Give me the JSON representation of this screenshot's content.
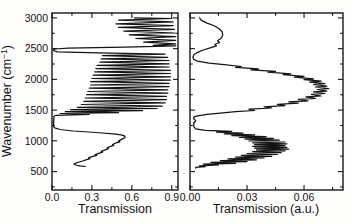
{
  "figure": {
    "kind": "dual-panel transmission spectra",
    "background_color": "#fdfdfc",
    "ink_color": "#161616"
  },
  "y_axis": {
    "label_pre": "Wavenumber (cm",
    "label_sup": "−1",
    "label_post": ")"
  },
  "chart_data": {
    "type": "line",
    "title": "",
    "ylabel": "Wavenumber (cm−1)",
    "ylim": [
      200,
      3080
    ],
    "yticks": [
      500,
      1000,
      1500,
      2000,
      2500,
      3000
    ],
    "ytick_labels": [
      "500",
      "1000",
      "1500",
      "2000",
      "2500",
      "3000"
    ],
    "yticks_minor": [
      250,
      750,
      1250,
      1750,
      2250,
      2750
    ],
    "grid": false,
    "legend": false,
    "panels": [
      {
        "name": "left",
        "xlabel": "Transmission",
        "xlim": [
          0,
          0.947
        ],
        "xticks": [
          0.0,
          0.3,
          0.6,
          0.9
        ],
        "xtick_labels": [
          "0.0",
          "0.3",
          "0.6",
          "0.9"
        ],
        "xticks_minor": [
          0.15,
          0.45,
          0.75
        ],
        "series": [
          {
            "name": "film-transmission-spectrum",
            "points": [
              [
                0.62,
                3000
              ],
              [
                0.9,
                2990
              ],
              [
                0.5,
                2965
              ],
              [
                0.91,
                2935
              ],
              [
                0.48,
                2905
              ],
              [
                0.91,
                2875
              ],
              [
                0.5,
                2845
              ],
              [
                0.92,
                2815
              ],
              [
                0.54,
                2785
              ],
              [
                0.92,
                2755
              ],
              [
                0.58,
                2725
              ],
              [
                0.93,
                2695
              ],
              [
                0.63,
                2665
              ],
              [
                0.93,
                2635
              ],
              [
                0.69,
                2605
              ],
              [
                0.93,
                2578
              ],
              [
                0.76,
                2555
              ],
              [
                0.93,
                2545
              ],
              [
                0.55,
                2525
              ],
              [
                0.12,
                2508
              ],
              [
                0.02,
                2495
              ],
              [
                0.01,
                2470
              ],
              [
                0.04,
                2448
              ],
              [
                0.35,
                2430
              ],
              [
                0.85,
                2412
              ],
              [
                0.38,
                2386
              ],
              [
                0.87,
                2360
              ],
              [
                0.37,
                2333
              ],
              [
                0.88,
                2307
              ],
              [
                0.36,
                2280
              ],
              [
                0.88,
                2254
              ],
              [
                0.34,
                2227
              ],
              [
                0.88,
                2201
              ],
              [
                0.33,
                2174
              ],
              [
                0.89,
                2148
              ],
              [
                0.32,
                2121
              ],
              [
                0.89,
                2095
              ],
              [
                0.31,
                2068
              ],
              [
                0.89,
                2042
              ],
              [
                0.3,
                2015
              ],
              [
                0.89,
                1989
              ],
              [
                0.29,
                1962
              ],
              [
                0.88,
                1936
              ],
              [
                0.29,
                1909
              ],
              [
                0.88,
                1883
              ],
              [
                0.28,
                1856
              ],
              [
                0.87,
                1830
              ],
              [
                0.27,
                1803
              ],
              [
                0.87,
                1777
              ],
              [
                0.26,
                1750
              ],
              [
                0.86,
                1724
              ],
              [
                0.25,
                1697
              ],
              [
                0.86,
                1671
              ],
              [
                0.24,
                1644
              ],
              [
                0.85,
                1618
              ],
              [
                0.22,
                1591
              ],
              [
                0.83,
                1565
              ],
              [
                0.19,
                1544
              ],
              [
                0.79,
                1526
              ],
              [
                0.14,
                1508
              ],
              [
                0.68,
                1490
              ],
              [
                0.1,
                1474
              ],
              [
                0.5,
                1458
              ],
              [
                0.06,
                1444
              ],
              [
                0.28,
                1428
              ],
              [
                0.03,
                1415
              ],
              [
                0.015,
                1400
              ],
              [
                0.012,
                1300
              ],
              [
                0.012,
                1230
              ],
              [
                0.02,
                1210
              ],
              [
                0.06,
                1185
              ],
              [
                0.16,
                1160
              ],
              [
                0.33,
                1135
              ],
              [
                0.46,
                1115
              ],
              [
                0.52,
                1098
              ],
              [
                0.545,
                1080
              ],
              [
                0.55,
                1062
              ],
              [
                0.54,
                1040
              ],
              [
                0.515,
                1015
              ],
              [
                0.5,
                995
              ],
              [
                0.51,
                985
              ],
              [
                0.475,
                962
              ],
              [
                0.455,
                940
              ],
              [
                0.465,
                928
              ],
              [
                0.435,
                905
              ],
              [
                0.415,
                885
              ],
              [
                0.425,
                872
              ],
              [
                0.395,
                850
              ],
              [
                0.37,
                828
              ],
              [
                0.38,
                816
              ],
              [
                0.35,
                795
              ],
              [
                0.325,
                775
              ],
              [
                0.335,
                763
              ],
              [
                0.3,
                742
              ],
              [
                0.275,
                722
              ],
              [
                0.285,
                710
              ],
              [
                0.255,
                690
              ],
              [
                0.23,
                672
              ],
              [
                0.205,
                655
              ],
              [
                0.18,
                638
              ],
              [
                0.165,
                622
              ],
              [
                0.175,
                606
              ],
              [
                0.21,
                593
              ],
              [
                0.25,
                583
              ]
            ]
          }
        ]
      },
      {
        "name": "right",
        "xlabel": "Transmission (a.u.)",
        "xlim": [
          0,
          0.0805
        ],
        "xticks": [
          0.0,
          0.03,
          0.06
        ],
        "xtick_labels": [
          "0.00",
          "0.03",
          "0.06"
        ],
        "xticks_minor": [
          0.015,
          0.045,
          0.075
        ],
        "series": [
          {
            "name": "reference-transmission-spectrum",
            "points": [
              [
                0.005,
                3000
              ],
              [
                0.006,
                2960
              ],
              [
                0.009,
                2915
              ],
              [
                0.013,
                2868
              ],
              [
                0.0155,
                2820
              ],
              [
                0.017,
                2770
              ],
              [
                0.0172,
                2720
              ],
              [
                0.0165,
                2672
              ],
              [
                0.0145,
                2630
              ],
              [
                0.0155,
                2600
              ],
              [
                0.013,
                2568
              ],
              [
                0.014,
                2545
              ],
              [
                0.011,
                2515
              ],
              [
                0.007,
                2478
              ],
              [
                0.004,
                2440
              ],
              [
                0.002,
                2400
              ],
              [
                0.0015,
                2360
              ],
              [
                0.002,
                2325
              ],
              [
                0.004,
                2295
              ],
              [
                0.01,
                2265
              ],
              [
                0.018,
                2238
              ],
              [
                0.027,
                2210
              ],
              [
                0.024,
                2196
              ],
              [
                0.036,
                2170
              ],
              [
                0.032,
                2156
              ],
              [
                0.045,
                2130
              ],
              [
                0.041,
                2116
              ],
              [
                0.053,
                2090
              ],
              [
                0.049,
                2076
              ],
              [
                0.06,
                2050
              ],
              [
                0.055,
                2036
              ],
              [
                0.065,
                2010
              ],
              [
                0.06,
                1996
              ],
              [
                0.069,
                1970
              ],
              [
                0.063,
                1956
              ],
              [
                0.071,
                1930
              ],
              [
                0.065,
                1916
              ],
              [
                0.072,
                1890
              ],
              [
                0.066,
                1876
              ],
              [
                0.073,
                1850
              ],
              [
                0.067,
                1836
              ],
              [
                0.072,
                1810
              ],
              [
                0.065,
                1796
              ],
              [
                0.071,
                1770
              ],
              [
                0.064,
                1756
              ],
              [
                0.069,
                1730
              ],
              [
                0.061,
                1716
              ],
              [
                0.066,
                1690
              ],
              [
                0.057,
                1674
              ],
              [
                0.062,
                1652
              ],
              [
                0.052,
                1634
              ],
              [
                0.057,
                1614
              ],
              [
                0.046,
                1594
              ],
              [
                0.05,
                1574
              ],
              [
                0.039,
                1554
              ],
              [
                0.043,
                1534
              ],
              [
                0.031,
                1514
              ],
              [
                0.034,
                1494
              ],
              [
                0.024,
                1474
              ],
              [
                0.016,
                1452
              ],
              [
                0.009,
                1430
              ],
              [
                0.004,
                1408
              ],
              [
                0.002,
                1386
              ],
              [
                0.002,
                1360
              ],
              [
                0.003,
                1330
              ],
              [
                0.002,
                1290
              ],
              [
                0.002,
                1230
              ],
              [
                0.003,
                1195
              ],
              [
                0.008,
                1172
              ],
              [
                0.022,
                1155
              ],
              [
                0.014,
                1142
              ],
              [
                0.028,
                1126
              ],
              [
                0.018,
                1113
              ],
              [
                0.034,
                1097
              ],
              [
                0.022,
                1084
              ],
              [
                0.04,
                1068
              ],
              [
                0.026,
                1055
              ],
              [
                0.044,
                1039
              ],
              [
                0.029,
                1026
              ],
              [
                0.047,
                1010
              ],
              [
                0.031,
                997
              ],
              [
                0.05,
                981
              ],
              [
                0.033,
                968
              ],
              [
                0.051,
                952
              ],
              [
                0.034,
                939
              ],
              [
                0.05,
                923
              ],
              [
                0.033,
                910
              ],
              [
                0.051,
                894
              ],
              [
                0.034,
                881
              ],
              [
                0.052,
                865
              ],
              [
                0.035,
                852
              ],
              [
                0.05,
                836
              ],
              [
                0.033,
                823
              ],
              [
                0.048,
                807
              ],
              [
                0.03,
                794
              ],
              [
                0.046,
                778
              ],
              [
                0.027,
                765
              ],
              [
                0.043,
                749
              ],
              [
                0.024,
                736
              ],
              [
                0.039,
                720
              ],
              [
                0.02,
                707
              ],
              [
                0.035,
                691
              ],
              [
                0.016,
                678
              ],
              [
                0.03,
                662
              ],
              [
                0.011,
                649
              ],
              [
                0.024,
                634
              ],
              [
                0.007,
                620
              ],
              [
                0.015,
                606
              ],
              [
                0.005,
                592
              ],
              [
                0.008,
                580
              ],
              [
                0.003,
                568
              ],
              [
                0.003,
                556
              ]
            ]
          }
        ]
      }
    ]
  }
}
